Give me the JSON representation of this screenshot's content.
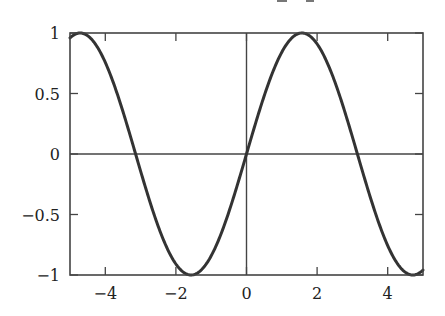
{
  "chart_data": {
    "type": "line",
    "title": "",
    "xlabel": "",
    "ylabel": "",
    "xlim": [
      -5,
      5
    ],
    "ylim": [
      -1,
      1
    ],
    "grid": false,
    "legend": null,
    "function": "sin(x)",
    "series": [
      {
        "name": "sin(x)",
        "color": "#333333",
        "x": [
          -5,
          -4.5,
          -4,
          -3.5,
          -3,
          -2.5,
          -2,
          -1.5708,
          -1.5,
          -1,
          -0.5,
          0,
          0.5,
          1,
          1.5,
          1.5708,
          2,
          2.5,
          3,
          3.5,
          4,
          4.5,
          5
        ],
        "y": [
          0.959,
          0.978,
          0.757,
          0.351,
          -0.141,
          -0.598,
          -0.909,
          -1.0,
          -0.997,
          -0.841,
          -0.479,
          0,
          0.479,
          0.841,
          0.997,
          1.0,
          0.909,
          0.598,
          0.141,
          -0.351,
          -0.757,
          -0.978,
          -0.959
        ]
      }
    ],
    "reference_lines": [
      {
        "orientation": "horizontal",
        "value": 0
      },
      {
        "orientation": "vertical",
        "value": 0
      }
    ],
    "x_ticks": [
      {
        "value": -4,
        "label": "−4"
      },
      {
        "value": -2,
        "label": "−2"
      },
      {
        "value": 0,
        "label": "0"
      },
      {
        "value": 2,
        "label": "2"
      },
      {
        "value": 4,
        "label": "4"
      }
    ],
    "y_ticks": [
      {
        "value": 1,
        "label": "1"
      },
      {
        "value": 0.5,
        "label": "0.5"
      },
      {
        "value": 0,
        "label": "0"
      },
      {
        "value": -0.5,
        "label": "−0.5"
      },
      {
        "value": -1,
        "label": "−1"
      }
    ]
  },
  "style": {
    "axis_color": "#444444",
    "curve_color": "#333333",
    "background": "#ffffff"
  }
}
